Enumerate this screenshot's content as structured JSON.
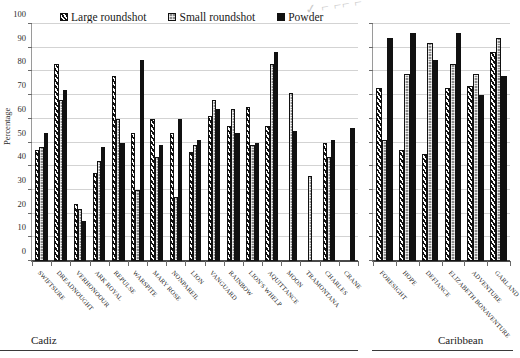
{
  "scribble": "✓ ⌐ ⌐⌐ ⌐",
  "legend": {
    "items": [
      {
        "label": "Large roundshot",
        "pattern": "diagonal-stripe",
        "color": "#111111"
      },
      {
        "label": "Small roundshot",
        "pattern": "gray-checker",
        "color": "#8a8a8a"
      },
      {
        "label": "Powder",
        "pattern": "solid",
        "color": "#111111"
      }
    ]
  },
  "captions": {
    "left": "Cadiz",
    "right": "Caribbean"
  },
  "chart_data": {
    "type": "bar",
    "title": "",
    "subtitle": "",
    "xlabel": "",
    "ylabel": "Percentage",
    "ylim": [
      0,
      100
    ],
    "ytick_step": 10,
    "yticks": [
      0,
      10,
      20,
      30,
      40,
      50,
      60,
      70,
      80,
      90,
      100
    ],
    "ytick_labels": [
      "0",
      "10",
      "20",
      "30",
      "40",
      "50",
      "60",
      "70",
      "80",
      "90",
      "100"
    ],
    "grid": true,
    "legend_position": "top",
    "series_names": [
      "Large roundshot",
      "Small roundshot",
      "Powder"
    ],
    "panels": [
      {
        "name": "Cadiz",
        "categories": [
          "SWIFTSURE",
          "DREADNOUGHT",
          "VERHONOOUR",
          "ARK ROYAL",
          "REPULSE",
          "WARSPITE",
          "MARY ROSE",
          "NONPAREIL",
          "LION",
          "VANGUARD",
          "RAINBOW",
          "LION'S WHELP",
          "AQUITTANCE",
          "MOON",
          "TRAMONTANA",
          "CHARLES",
          "CRANE"
        ],
        "series": [
          {
            "name": "Large roundshot",
            "values": [
              47,
              83,
              24,
              37,
              78,
              54,
              60,
              54,
              46,
              61,
              57,
              65,
              57,
              null,
              null,
              50,
              null
            ]
          },
          {
            "name": "Small roundshot",
            "values": [
              48,
              68,
              22,
              42,
              60,
              30,
              44,
              27,
              49,
              68,
              64,
              49,
              83,
              71,
              36,
              44,
              null
            ]
          },
          {
            "name": "Powder",
            "values": [
              54,
              72,
              17,
              48,
              50,
              85,
              49,
              60,
              51,
              64,
              54,
              50,
              88,
              55,
              null,
              51,
              56
            ]
          }
        ]
      },
      {
        "name": "Caribbean",
        "categories": [
          "FORESIGHT",
          "HOPE",
          "DEFIANCE",
          "ELIZABETH BONAVENTURE",
          "ADVENTURE",
          "GARLAND"
        ],
        "series": [
          {
            "name": "Large roundshot",
            "values": [
              73,
              47,
              45,
              73,
              74,
              88
            ]
          },
          {
            "name": "Small roundshot",
            "values": [
              51,
              79,
              92,
              83,
              79,
              94
            ]
          },
          {
            "name": "Powder",
            "values": [
              94,
              96,
              85,
              96,
              70,
              78
            ]
          }
        ]
      }
    ]
  }
}
